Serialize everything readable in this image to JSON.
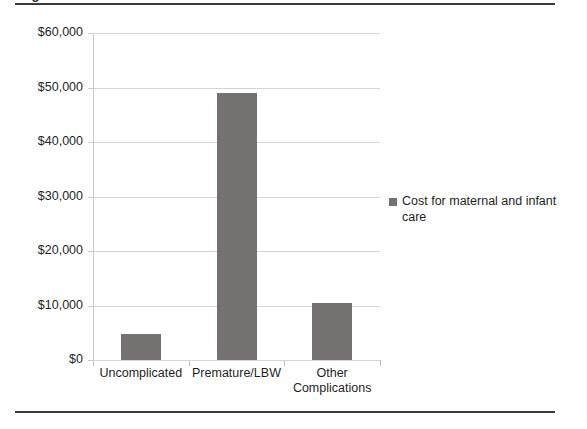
{
  "figure": {
    "caption_fragment": "Figure",
    "top_rule_color": "#3a3a3a",
    "bottom_rule_color": "#3a3a3a"
  },
  "chart_data": {
    "type": "bar",
    "title": "",
    "subtitle": "",
    "xlabel": "",
    "ylabel": "",
    "categories": [
      "Uncomplicated",
      "Premature/LBW",
      "Other Complications"
    ],
    "category_lines": [
      [
        "Uncomplicated"
      ],
      [
        "Premature/LBW"
      ],
      [
        "Other",
        "Complications"
      ]
    ],
    "values": [
      4800,
      49000,
      10500
    ],
    "value_labels": [
      "$4,800",
      "$49,000",
      "$10,500"
    ],
    "series": [
      {
        "name": "Cost for maternal and infant care",
        "color": "#767171",
        "values": [
          4800,
          49000,
          10500
        ]
      }
    ],
    "ylim": [
      0,
      60000
    ],
    "ytick_values": [
      0,
      10000,
      20000,
      30000,
      40000,
      50000,
      60000
    ],
    "ytick_labels": [
      "$0",
      "$10,000",
      "$20,000",
      "$30,000",
      "$40,000",
      "$50,000",
      "$60,000"
    ],
    "grid": true,
    "grid_color": "#d6d6d6",
    "legend_position": "right",
    "legend_entries": [
      {
        "label": "Cost for maternal and infant care",
        "color": "#767171"
      }
    ]
  },
  "legend": {
    "entry_label": "Cost for maternal and infant care",
    "swatch_color": "#767171"
  }
}
